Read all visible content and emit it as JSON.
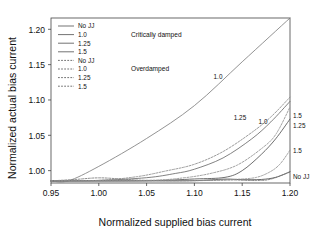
{
  "chart_data": {
    "type": "line",
    "title": "",
    "xlabel": "Normalized supplied bias current",
    "ylabel": "Normalized actual bias current",
    "xlim": [
      0.95,
      1.2
    ],
    "ylim": [
      0.9825,
      1.216
    ],
    "xticks": [
      "0.95",
      "1.00",
      "1.05",
      "1.10",
      "1.15",
      "1.20"
    ],
    "xtick_values": [
      0.95,
      1.0,
      1.05,
      1.1,
      1.15,
      1.2
    ],
    "yticks": [
      "1.00",
      "1.05",
      "1.10",
      "1.15",
      "1.20"
    ],
    "ytick_values": [
      1.0,
      1.05,
      1.1,
      1.15,
      1.2
    ],
    "grid": false,
    "legend_position": "upper-left-inside",
    "baseline_value": 0.9855,
    "series": [
      {
        "name": "No JJ",
        "label": "No JJ",
        "group": "Critically damped",
        "style": "solid",
        "color": "#4d4d4d",
        "x": [
          0.95,
          1.0,
          1.05,
          1.1,
          1.132,
          1.15,
          1.17,
          1.185,
          1.2
        ],
        "y": [
          0.9855,
          0.9855,
          0.9855,
          0.9858,
          0.988,
          0.9872,
          0.9875,
          0.9905,
          0.9985
        ]
      },
      {
        "name": "1.0 critically damped",
        "label": "1.0",
        "group": "Critically damped",
        "style": "solid",
        "color": "#808080",
        "x": [
          0.95,
          0.968,
          1.0,
          1.05,
          1.1,
          1.15,
          1.2
        ],
        "y": [
          0.9855,
          0.9855,
          1.006,
          1.0455,
          1.092,
          1.154,
          1.216
        ]
      },
      {
        "name": "1.25 critically damped",
        "label": "1.25",
        "group": "Critically damped",
        "style": "solid",
        "color": "#6b6b6b",
        "x": [
          0.95,
          1.0,
          1.05,
          1.08,
          1.1,
          1.13,
          1.16,
          1.18,
          1.2
        ],
        "y": [
          0.9855,
          0.9862,
          0.99,
          0.996,
          1.002,
          1.018,
          1.045,
          1.069,
          1.098
        ]
      },
      {
        "name": "1.5 critically damped",
        "label": "1.5",
        "group": "Critically damped",
        "style": "solid",
        "color": "#555555",
        "x": [
          0.95,
          1.05,
          1.1,
          1.132,
          1.15,
          1.17,
          1.185,
          1.2
        ],
        "y": [
          0.9855,
          0.9858,
          0.9882,
          0.9905,
          1.0,
          1.023,
          1.045,
          1.073
        ]
      },
      {
        "name": "No JJ overdamped",
        "label": "No JJ",
        "group": "Overdamped",
        "style": "dashed",
        "color": "#777777",
        "x": [
          0.95,
          0.975,
          1.0,
          1.025,
          1.05,
          1.1,
          1.14,
          1.165,
          1.18,
          1.2
        ],
        "y": [
          0.9855,
          0.9875,
          0.9898,
          0.988,
          0.9862,
          0.9858,
          0.9868,
          0.986,
          0.988,
          0.998
        ]
      },
      {
        "name": "1.0 overdamped",
        "label": "1.0",
        "group": "Overdamped",
        "style": "dashed",
        "color": "#8a8a8a",
        "x": [
          0.95,
          1.0,
          1.04,
          1.07,
          1.1,
          1.13,
          1.16,
          1.18,
          1.2
        ],
        "y": [
          0.9855,
          0.9862,
          0.9915,
          0.9995,
          1.009,
          1.027,
          1.054,
          1.076,
          1.104
        ]
      },
      {
        "name": "1.25 overdamped",
        "label": "1.25",
        "group": "Overdamped",
        "style": "dashed",
        "color": "#909090",
        "x": [
          0.95,
          1.05,
          1.09,
          1.12,
          1.145,
          1.17,
          1.185,
          1.2
        ],
        "y": [
          0.9855,
          0.9862,
          0.99,
          0.997,
          1.008,
          1.031,
          1.051,
          1.09
        ]
      },
      {
        "name": "1.5 overdamped",
        "label": "1.5",
        "group": "Overdamped",
        "style": "dashed",
        "color": "#8f8f8f",
        "x": [
          0.95,
          1.08,
          1.12,
          1.145,
          1.165,
          1.18,
          1.19,
          1.2
        ],
        "y": [
          0.9855,
          0.9858,
          0.9866,
          0.9878,
          0.9905,
          0.999,
          1.01,
          1.029
        ]
      }
    ],
    "legend": {
      "entries": [
        {
          "label": "No JJ",
          "style": "solid"
        },
        {
          "label": "1.0",
          "style": "solid"
        },
        {
          "label": "1.25",
          "style": "solid"
        },
        {
          "label": "1.5",
          "style": "solid"
        },
        {
          "label": "No JJ",
          "style": "dashed"
        },
        {
          "label": "1.0",
          "style": "dashed"
        },
        {
          "label": "1.25",
          "style": "dashed"
        },
        {
          "label": "1.5",
          "style": "dashed"
        }
      ],
      "group_labels": [
        {
          "text": "Critically damped"
        },
        {
          "text": "Overdamped"
        }
      ]
    },
    "annotations": [
      {
        "text": "1.0",
        "x": 218,
        "y": 79,
        "anchor": "middle"
      },
      {
        "text": "1.25",
        "x": 240,
        "y": 120,
        "anchor": "middle"
      },
      {
        "text": "1.0",
        "x": 263,
        "y": 124,
        "anchor": "middle"
      },
      {
        "text": "1.5",
        "x": 293,
        "y": 118,
        "anchor": "start"
      },
      {
        "text": "1.25",
        "x": 293,
        "y": 128,
        "anchor": "start"
      },
      {
        "text": "1.5",
        "x": 293,
        "y": 153,
        "anchor": "start"
      },
      {
        "text": "No JJ",
        "x": 293,
        "y": 179,
        "anchor": "start"
      }
    ]
  }
}
